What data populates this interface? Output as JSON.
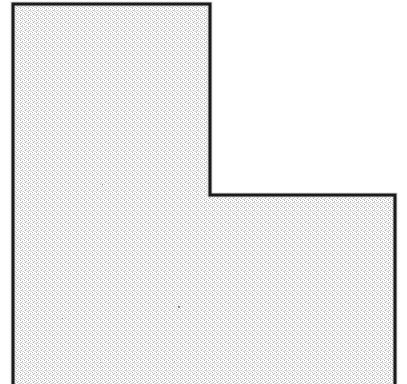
{
  "figure": {
    "background_color": "#ffffff",
    "fill_pattern": "halftone-checkerboard-dither",
    "fill_dot_color": "#b8b8b8",
    "fill_base_color": "#ffffff",
    "outline_color": "#1a1a1a",
    "outline_width_px": 3,
    "canvas": {
      "width": 407,
      "height": 384
    },
    "shape": {
      "type": "polygon",
      "name": "L-shape",
      "vertex_count": 6,
      "clipped_at_bottom": true,
      "points": [
        {
          "name": "top-left",
          "x": 13,
          "y": 4
        },
        {
          "name": "top-right-of-vertical-arm",
          "x": 210,
          "y": 4
        },
        {
          "name": "inner-notch-corner",
          "x": 210,
          "y": 195
        },
        {
          "name": "top-right-of-horizontal-arm",
          "x": 395,
          "y": 195
        },
        {
          "name": "bottom-right-clipped",
          "x": 395,
          "y": 384
        },
        {
          "name": "bottom-left-clipped",
          "x": 13,
          "y": 384
        }
      ],
      "points_path": "13,4 210,4 210,195 395,195 395,384 13,384"
    },
    "specks": [
      {
        "name": "speck-upper-mid",
        "x": 178,
        "y": 306,
        "size": 2
      },
      {
        "name": "speck-left-lower",
        "x": 49,
        "y": 330,
        "size": 1
      },
      {
        "name": "speck-mid-lower",
        "x": 100,
        "y": 362,
        "size": 1
      },
      {
        "name": "speck-mid-right",
        "x": 174,
        "y": 361,
        "size": 1
      },
      {
        "name": "speck-vertical-arm",
        "x": 102,
        "y": 184,
        "size": 1
      },
      {
        "name": "speck-center",
        "x": 62,
        "y": 318,
        "size": 1
      }
    ]
  }
}
